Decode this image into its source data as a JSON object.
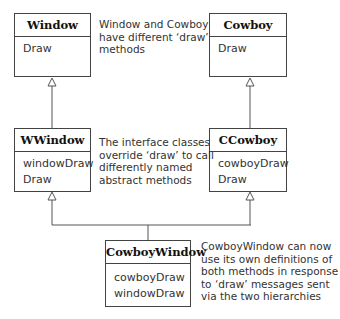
{
  "classes": {
    "window": {
      "name": "Window",
      "methods": [
        "Draw"
      ]
    },
    "cowboy": {
      "name": "Cowboy",
      "methods": [
        "Draw"
      ]
    },
    "wwindow": {
      "name": "WWindow",
      "methods": [
        "windowDraw",
        "Draw"
      ]
    },
    "ccowboy": {
      "name": "CCowboy",
      "methods": [
        "cowboyDraw",
        "Draw"
      ]
    },
    "cowboywindow": {
      "name": "CowboyWindow",
      "methods": [
        "cowboyDraw",
        "windowDraw"
      ]
    }
  },
  "notes": {
    "top": [
      "Window and Cowboy",
      "have different ‘draw’",
      "methods"
    ],
    "middle": [
      "The interface classes",
      "override ‘draw’ to call",
      "differently named",
      "abstract methods"
    ],
    "bottom": [
      "CowboyWindow can now",
      "use its own definitions of",
      "both methods in response",
      "to ‘draw’ messages sent",
      "via the two hierarchies"
    ]
  },
  "colors": {
    "line": "#555555",
    "border": "#444444",
    "text": "#333333"
  }
}
